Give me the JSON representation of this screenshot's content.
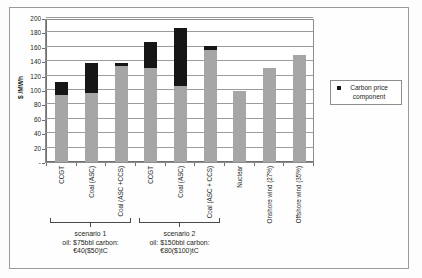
{
  "chart_data": {
    "type": "bar",
    "title": "",
    "subtitle": "",
    "xlabel": "",
    "ylabel": "$ /MWh",
    "ylim": [
      0,
      200
    ],
    "ytick_step": 20,
    "ytick_labels": [
      "-",
      "20",
      "40",
      "60",
      "80",
      "100",
      "120",
      "140",
      "160",
      "180",
      "200"
    ],
    "grid": true,
    "stacked": true,
    "legend_position": "right",
    "legend": [
      "Carbon price component"
    ],
    "categories": [
      "CCGT",
      "Coal (ASC)",
      "Coal (ASC +CCS)",
      "CCGT",
      "Coal (ASC)",
      "Coal (ASC + CCS)",
      "Nuclear",
      "Onshore wind (27%)",
      "Offshore wind (35%)"
    ],
    "series": [
      {
        "name": "Base generation cost",
        "color": "#a6a6a6",
        "values": [
          93,
          96,
          134,
          131,
          105,
          156,
          99,
          131,
          148
        ]
      },
      {
        "name": "Carbon price component",
        "color": "#161616",
        "values": [
          18,
          41,
          4,
          36,
          81,
          5,
          0,
          0,
          0
        ]
      }
    ],
    "totals": [
      111,
      137,
      138,
      167,
      186,
      161,
      99,
      131,
      148
    ],
    "groups": [
      {
        "label": "scenario 1",
        "detail_line1": "oil: $75bbl carbon:",
        "detail_line2": "€40($50)tC",
        "category_indices": [
          0,
          1,
          2
        ]
      },
      {
        "label": "scenario 2",
        "detail_line1": "oil: $150bbl carbon:",
        "detail_line2": "€80($100)tC",
        "category_indices": [
          3,
          4,
          5
        ]
      }
    ]
  },
  "legend": {
    "marker_name": "legend-square-marker",
    "label": "Carbon price component"
  }
}
